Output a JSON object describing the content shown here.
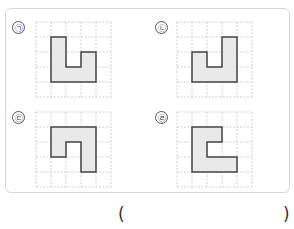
{
  "problem": {
    "grid": {
      "cols": 5,
      "rows": 5,
      "cell_px": 15,
      "line_color": "#cfcfcf",
      "shape_fill": "#e9e9e9",
      "shape_stroke": "#444444"
    },
    "options": [
      {
        "label": "㉠",
        "grid_origin": [
          36,
          22
        ],
        "shape_points": [
          [
            1,
            1
          ],
          [
            2,
            1
          ],
          [
            2,
            3
          ],
          [
            3,
            3
          ],
          [
            3,
            2
          ],
          [
            4,
            2
          ],
          [
            4,
            4
          ],
          [
            1,
            4
          ]
        ]
      },
      {
        "label": "㉡",
        "grid_origin": [
          177,
          22
        ],
        "shape_points": [
          [
            1,
            2
          ],
          [
            2,
            2
          ],
          [
            2,
            3
          ],
          [
            3,
            3
          ],
          [
            3,
            1
          ],
          [
            4,
            1
          ],
          [
            4,
            4
          ],
          [
            1,
            4
          ]
        ]
      },
      {
        "label": "㉢",
        "grid_origin": [
          36,
          112
        ],
        "shape_points": [
          [
            1,
            1
          ],
          [
            4,
            1
          ],
          [
            4,
            4
          ],
          [
            3,
            4
          ],
          [
            3,
            2
          ],
          [
            2,
            2
          ],
          [
            2,
            3
          ],
          [
            1,
            3
          ]
        ]
      },
      {
        "label": "㉣",
        "grid_origin": [
          177,
          112
        ],
        "shape_points": [
          [
            1,
            1
          ],
          [
            3,
            1
          ],
          [
            3,
            2
          ],
          [
            2,
            2
          ],
          [
            2,
            3
          ],
          [
            4,
            3
          ],
          [
            4,
            4
          ],
          [
            1,
            4
          ]
        ]
      }
    ],
    "answer": {
      "open_paren": "(",
      "close_paren": ")",
      "value": ""
    }
  }
}
